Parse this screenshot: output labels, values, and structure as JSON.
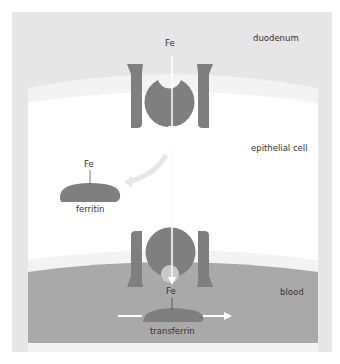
{
  "diagram": {
    "regions": {
      "lumen": "duodenum",
      "cell": "epithelial cell",
      "blood": "blood"
    },
    "labels": {
      "fe_top": "Fe",
      "fe_ferritin": "Fe",
      "ferritin": "ferritin",
      "fe_blood": "Fe",
      "transferrin": "transferrin"
    },
    "colors": {
      "frame": "#e6e6e6",
      "cell": "#ffffff",
      "membrane": "#f2f2f2",
      "blood": "#a9a9a9",
      "protein": "#7f7f7f",
      "arrow": "#ffffff"
    }
  }
}
